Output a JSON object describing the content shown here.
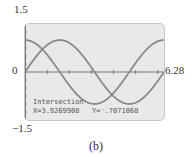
{
  "chart_data": {
    "type": "line",
    "title": "",
    "caption": "(b)",
    "xlim": [
      0,
      6.28
    ],
    "ylim": [
      -1.5,
      1.5
    ],
    "x_tick_spacing": 1,
    "y_tick_spacing": 0.25,
    "axis_labels": {
      "ymax": "1.5",
      "ymin": "−1.5",
      "xmin": "0",
      "xmax": "6.28"
    },
    "series": [
      {
        "name": "y = sin(x)",
        "function": "sin"
      },
      {
        "name": "y = cos(x)",
        "function": "cos"
      }
    ],
    "annotation": {
      "title": "Intersection",
      "x_text": "X=3.9269908",
      "y_text": "Y=⁻.7071068",
      "x": 3.9269908,
      "y": -0.7071068
    },
    "colors": {
      "screen": "#e9e9e9",
      "curve": "#8a8a8a",
      "axis": "#777777"
    }
  }
}
